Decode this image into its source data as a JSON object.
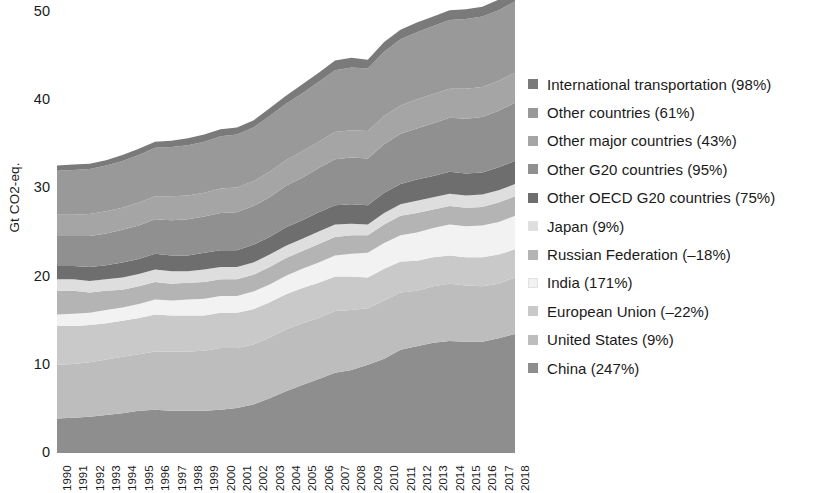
{
  "chart_data": {
    "type": "area",
    "stacked": true,
    "title": "",
    "xlabel": "",
    "ylabel": "Gt CO2-eq.",
    "ylim": [
      0,
      50
    ],
    "yticks": [
      0,
      10,
      20,
      30,
      40,
      50
    ],
    "grid": false,
    "legend_position": "right",
    "x": [
      1990,
      1991,
      1992,
      1993,
      1994,
      1995,
      1996,
      1997,
      1998,
      1999,
      2000,
      2001,
      2002,
      2003,
      2004,
      2005,
      2006,
      2007,
      2008,
      2009,
      2010,
      2011,
      2012,
      2013,
      2014,
      2015,
      2016,
      2017,
      2018
    ],
    "xtick_labels": [
      "1990",
      "1991",
      "1992",
      "1993",
      "1994",
      "1995",
      "1996",
      "1997",
      "1998",
      "1999",
      "2000",
      "2001",
      "2002",
      "2003",
      "2004",
      "2005",
      "2006",
      "2007",
      "2008",
      "2009",
      "2010",
      "2011",
      "2012",
      "2013",
      "2014",
      "2015",
      "2016",
      "2017",
      "2018"
    ],
    "stack_order_bottom_to_top": [
      "China",
      "United States",
      "European Union",
      "India",
      "Russian Federation",
      "Japan",
      "Other OECD G20 countries",
      "Other G20 countries",
      "Other major countries",
      "Other countries",
      "International transportation"
    ],
    "series": [
      {
        "name": "China (247%)",
        "key": "China",
        "color": "#8e8e8e",
        "values": [
          3.9,
          4.0,
          4.1,
          4.3,
          4.5,
          4.8,
          4.9,
          4.8,
          4.8,
          4.8,
          4.9,
          5.1,
          5.5,
          6.2,
          7.0,
          7.7,
          8.4,
          9.1,
          9.4,
          10.0,
          10.7,
          11.7,
          12.1,
          12.5,
          12.7,
          12.6,
          12.6,
          13.0,
          13.5
        ]
      },
      {
        "name": "United States (9%)",
        "key": "United States",
        "color": "#bdbdbd",
        "values": [
          6.1,
          6.1,
          6.2,
          6.3,
          6.4,
          6.4,
          6.6,
          6.7,
          6.7,
          6.8,
          7.0,
          6.8,
          6.8,
          6.9,
          7.0,
          7.0,
          6.9,
          7.0,
          6.8,
          6.4,
          6.6,
          6.5,
          6.3,
          6.4,
          6.5,
          6.4,
          6.3,
          6.2,
          6.4
        ]
      },
      {
        "name": "European Union (–22%)",
        "key": "European Union",
        "color": "#c9c9c9",
        "values": [
          4.4,
          4.3,
          4.2,
          4.1,
          4.1,
          4.1,
          4.2,
          4.1,
          4.1,
          4.0,
          4.0,
          4.0,
          4.0,
          4.0,
          4.0,
          4.0,
          4.0,
          3.9,
          3.8,
          3.5,
          3.6,
          3.5,
          3.4,
          3.3,
          3.2,
          3.2,
          3.3,
          3.3,
          3.2
        ]
      },
      {
        "name": "India (171%)",
        "key": "India",
        "color": "#f2f2f2",
        "values": [
          1.3,
          1.4,
          1.4,
          1.5,
          1.5,
          1.6,
          1.7,
          1.7,
          1.8,
          1.9,
          1.9,
          1.9,
          2.0,
          2.0,
          2.1,
          2.2,
          2.3,
          2.4,
          2.6,
          2.8,
          2.9,
          3.0,
          3.2,
          3.3,
          3.5,
          3.5,
          3.6,
          3.7,
          3.8
        ]
      },
      {
        "name": "Russian Federation (–18%)",
        "key": "Russian Federation",
        "color": "#b4b4b4",
        "values": [
          2.7,
          2.6,
          2.3,
          2.2,
          2.0,
          2.0,
          2.0,
          1.9,
          1.9,
          1.9,
          1.9,
          1.9,
          1.9,
          2.0,
          2.0,
          2.0,
          2.1,
          2.1,
          2.1,
          2.0,
          2.1,
          2.2,
          2.2,
          2.1,
          2.1,
          2.1,
          2.1,
          2.2,
          2.2
        ]
      },
      {
        "name": "Japan (9%)",
        "key": "Japan",
        "color": "#dedede",
        "values": [
          1.3,
          1.3,
          1.3,
          1.3,
          1.4,
          1.4,
          1.4,
          1.4,
          1.3,
          1.4,
          1.4,
          1.4,
          1.4,
          1.4,
          1.4,
          1.4,
          1.4,
          1.4,
          1.3,
          1.2,
          1.3,
          1.3,
          1.4,
          1.4,
          1.4,
          1.4,
          1.4,
          1.4,
          1.4
        ]
      },
      {
        "name": "Other OECD G20 countries (75%)",
        "key": "Other OECD G20 countries",
        "color": "#6e6e6e",
        "values": [
          1.5,
          1.5,
          1.6,
          1.6,
          1.7,
          1.7,
          1.8,
          1.8,
          1.8,
          1.9,
          1.9,
          1.9,
          2.0,
          2.0,
          2.1,
          2.1,
          2.2,
          2.2,
          2.2,
          2.2,
          2.3,
          2.3,
          2.4,
          2.4,
          2.5,
          2.5,
          2.5,
          2.6,
          2.6
        ]
      },
      {
        "name": "Other G20 countries (95%)",
        "key": "Other G20 countries",
        "color": "#909090",
        "values": [
          3.4,
          3.4,
          3.5,
          3.6,
          3.7,
          3.8,
          3.9,
          4.0,
          4.1,
          4.1,
          4.2,
          4.3,
          4.4,
          4.5,
          4.7,
          4.8,
          5.0,
          5.2,
          5.3,
          5.3,
          5.5,
          5.7,
          5.8,
          6.0,
          6.1,
          6.2,
          6.3,
          6.4,
          6.6
        ]
      },
      {
        "name": "Other major countries (43%)",
        "key": "Other major countries",
        "color": "#a5a5a5",
        "values": [
          2.4,
          2.4,
          2.5,
          2.5,
          2.5,
          2.6,
          2.6,
          2.7,
          2.7,
          2.7,
          2.8,
          2.8,
          2.8,
          2.9,
          2.9,
          3.0,
          3.0,
          3.1,
          3.1,
          3.1,
          3.2,
          3.2,
          3.3,
          3.3,
          3.3,
          3.4,
          3.4,
          3.4,
          3.4
        ]
      },
      {
        "name": "Other countries (61%)",
        "key": "Other countries",
        "color": "#999999",
        "values": [
          5.0,
          5.1,
          5.1,
          5.2,
          5.3,
          5.4,
          5.5,
          5.6,
          5.7,
          5.8,
          5.9,
          6.0,
          6.1,
          6.3,
          6.4,
          6.6,
          6.8,
          7.0,
          7.1,
          7.1,
          7.3,
          7.5,
          7.6,
          7.7,
          7.8,
          7.9,
          8.0,
          8.0,
          8.1
        ]
      },
      {
        "name": "International transportation (98%)",
        "key": "International transportation",
        "color": "#7a7a7a",
        "values": [
          0.6,
          0.6,
          0.6,
          0.6,
          0.7,
          0.7,
          0.7,
          0.7,
          0.8,
          0.8,
          0.8,
          0.8,
          0.8,
          0.9,
          0.9,
          1.0,
          1.0,
          1.1,
          1.1,
          1.0,
          1.1,
          1.1,
          1.1,
          1.1,
          1.1,
          1.1,
          1.1,
          1.2,
          1.2
        ]
      }
    ]
  },
  "legend": {
    "items": [
      {
        "label": "International transportation (98%)",
        "color": "#7a7a7a"
      },
      {
        "label": "Other countries (61%)",
        "color": "#999999"
      },
      {
        "label": "Other major countries (43%)",
        "color": "#a5a5a5"
      },
      {
        "label": "Other G20 countries (95%)",
        "color": "#909090"
      },
      {
        "label": "Other OECD G20 countries (75%)",
        "color": "#6e6e6e"
      },
      {
        "label": "Japan (9%)",
        "color": "#dedede"
      },
      {
        "label": "Russian Federation (–18%)",
        "color": "#b4b4b4"
      },
      {
        "label": "India (171%)",
        "color": "#f2f2f2"
      },
      {
        "label": "European Union (–22%)",
        "color": "#c9c9c9"
      },
      {
        "label": "United States (9%)",
        "color": "#bdbdbd"
      },
      {
        "label": "China (247%)",
        "color": "#8e8e8e"
      }
    ]
  }
}
